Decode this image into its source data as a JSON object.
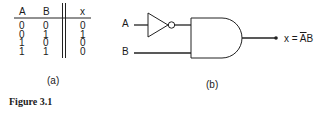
{
  "figure": {
    "caption": "Figure 3.1",
    "truth_table": {
      "label": "(a)",
      "headers": [
        "A",
        "B",
        "x"
      ],
      "rows": [
        [
          "0",
          "0",
          "0"
        ],
        [
          "0",
          "1",
          "1"
        ],
        [
          "1",
          "0",
          "0"
        ],
        [
          "1",
          "1",
          "0"
        ]
      ]
    },
    "circuit": {
      "label": "(b)",
      "input_a": "A",
      "input_b": "B",
      "output_prefix": "x = ",
      "output_a_bar": "A",
      "output_b": "B",
      "gates": [
        "NOT",
        "AND"
      ]
    }
  }
}
